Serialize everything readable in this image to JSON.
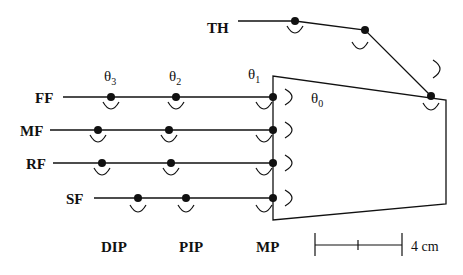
{
  "diagram": {
    "fingers": [
      {
        "label": "FF",
        "y": 97,
        "dip_x": 111,
        "pip_x": 176
      },
      {
        "label": "MF",
        "y": 130,
        "dip_x": 98,
        "pip_x": 169
      },
      {
        "label": "RF",
        "y": 163,
        "dip_x": 102,
        "pip_x": 171
      },
      {
        "label": "SF",
        "y": 198,
        "dip_x": 138,
        "pip_x": 186
      }
    ],
    "thumb": {
      "label": "TH"
    },
    "angles": {
      "theta0": "θ",
      "theta0_sub": "0",
      "theta1": "θ",
      "theta1_sub": "1",
      "theta2": "θ",
      "theta2_sub": "2",
      "theta3": "θ",
      "theta3_sub": "3"
    },
    "joint_labels": {
      "dip": "DIP",
      "pip": "PIP",
      "mp": "MP"
    },
    "scale_bar": {
      "label": "4 cm"
    },
    "colors": {
      "line": "#111111",
      "background": "#ffffff"
    }
  }
}
